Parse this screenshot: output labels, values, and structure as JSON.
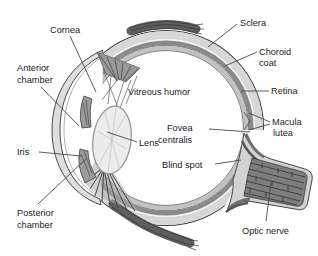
{
  "diagram": {
    "type": "anatomical-diagram",
    "labels": {
      "cornea": {
        "lines": [
          "Cornea"
        ]
      },
      "sclera": {
        "lines": [
          "Sclera"
        ]
      },
      "choroid_coat": {
        "lines": [
          "Choroid",
          "coat"
        ]
      },
      "anterior_chamber": {
        "lines": [
          "Anterior",
          "chamber"
        ]
      },
      "vitreous_humor": {
        "lines": [
          "Vitreous humor"
        ]
      },
      "retina": {
        "lines": [
          "Retina"
        ]
      },
      "macula_lutea": {
        "lines": [
          "Macula",
          "lutea"
        ]
      },
      "fovea_centralis": {
        "lines": [
          "Fovea",
          "centralis"
        ]
      },
      "iris": {
        "lines": [
          "Iris"
        ]
      },
      "lens": {
        "lines": [
          "Lens"
        ]
      },
      "blind_spot": {
        "lines": [
          "Blind spot"
        ]
      },
      "posterior_chamber": {
        "lines": [
          "Posterior",
          "chamber"
        ]
      },
      "optic_nerve": {
        "lines": [
          "Optic nerve"
        ]
      }
    },
    "colors": {
      "background": "#ffffff",
      "sclera": "#d7d7d7",
      "choroid": "#8a8a8a",
      "retina": "#c2c2c2",
      "cornea": "#dedede",
      "lens": "#ececec",
      "iris": "#9a9a9a",
      "muscle": "#5e5e5e",
      "optic_nerve_core": "#7d7d7d",
      "optic_nerve_sheath": "#d2d2d2",
      "outline": "#424242",
      "leader_line": "#4a4a4a",
      "label_text": "#1c1c1c"
    }
  }
}
